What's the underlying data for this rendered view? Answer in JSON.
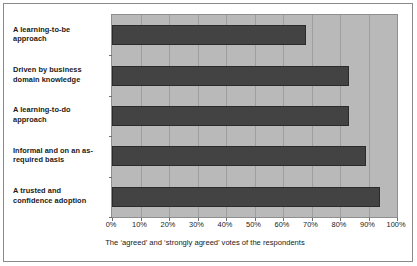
{
  "chart_data": {
    "type": "bar",
    "orientation": "horizontal",
    "title": "",
    "xlabel": "The ‘agreed’ and ‘strongly agreed’ votes of the respondents",
    "ylabel": "",
    "xlim": [
      0,
      100
    ],
    "xticks": [
      "0%",
      "10%",
      "20%",
      "30%",
      "40%",
      "50%",
      "60%",
      "70%",
      "80%",
      "90%",
      "100%"
    ],
    "grid": true,
    "legend": false,
    "categories": [
      "A learning-to-be approach",
      "Driven by business domain knowledge",
      "A learning-to-do approach",
      "Informal and on an as-required basis",
      "A trusted and confidence adoption"
    ],
    "category_lines": [
      [
        "A learning-to-be",
        "approach"
      ],
      [
        "Driven by business",
        "domain knowledge"
      ],
      [
        "A learning-to-do",
        "approach"
      ],
      [
        "Informal and on an as-",
        "required basis"
      ],
      [
        "A trusted and",
        "confidence adoption"
      ]
    ],
    "values": [
      68,
      83,
      83,
      89,
      94
    ],
    "colors": {
      "bar_fill": "#434343",
      "bar_border": "#2b2b2b",
      "plot_background": "#b9b9b9",
      "gridline": "#9e9e9e",
      "frame_border": "#8a8a8a",
      "text": "#1a1a1a"
    }
  }
}
